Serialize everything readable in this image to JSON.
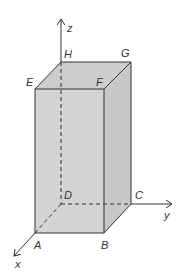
{
  "diagram": {
    "type": "3d-rectangular-prism-on-axes",
    "colors": {
      "face_fill": "#d4d4d4",
      "top_fill": "#cdcdcd",
      "side_fill": "#c8c8c8",
      "edge": "#333333",
      "axis": "#333333"
    },
    "axes": {
      "x": "x",
      "y": "y",
      "z": "z"
    },
    "vertices": {
      "A": "A",
      "B": "B",
      "C": "C",
      "D": "D",
      "E": "E",
      "F": "F",
      "G": "G",
      "H": "H"
    }
  }
}
